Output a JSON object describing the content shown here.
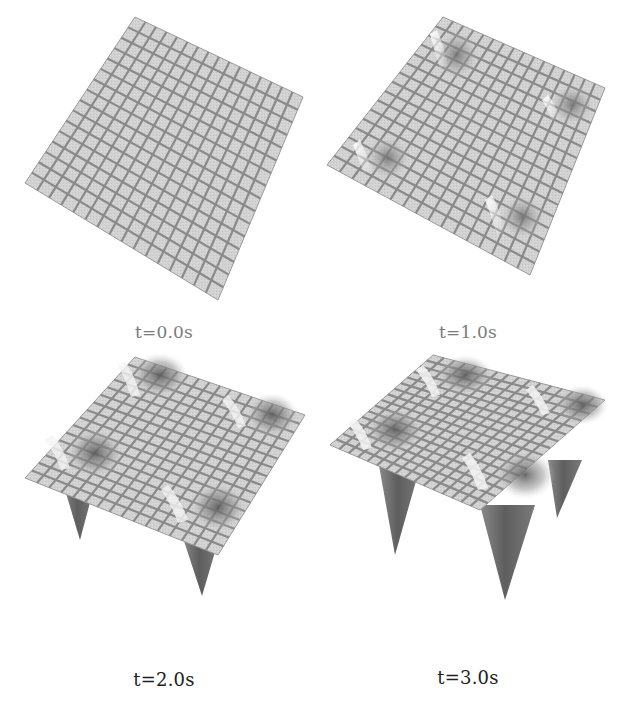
{
  "figure": {
    "panels": [
      {
        "id": "p0",
        "caption": "t=0.0s"
      },
      {
        "id": "p1",
        "caption": "t=1.0s"
      },
      {
        "id": "p2",
        "caption": "t=2.0s"
      },
      {
        "id": "p3",
        "caption": "t=3.0s"
      }
    ]
  },
  "colors": {
    "surface_fill": "#d0d0d0",
    "grid_line": "#8a8a8a",
    "dimple_shade": "#6e6e6e",
    "highlight": "#f2f2f2",
    "spike": "#6a6a6a",
    "caption_top": "#7a7a7a",
    "caption_bottom": "#1e1e1e"
  },
  "chart_data": [
    {
      "type": "surface",
      "title": "t=0.0s",
      "grid": "16x16",
      "description": "flat square mesh surface",
      "features": []
    },
    {
      "type": "surface",
      "title": "t=1.0s",
      "grid": "16x16",
      "description": "mesh surface with four shallow dimples near the corners",
      "features": [
        "dimple",
        "dimple",
        "dimple",
        "dimple"
      ]
    },
    {
      "type": "surface",
      "title": "t=2.0s",
      "grid": "16x16",
      "description": "mesh surface with four deeper depressions; two downward spikes visible below the plane",
      "features": [
        "depression",
        "depression",
        "depression+spike",
        "depression+spike"
      ]
    },
    {
      "type": "surface",
      "title": "t=3.0s",
      "grid": "16x16",
      "description": "mesh surface with four deep depressions; three long downward spikes visible below the plane",
      "features": [
        "depression",
        "depression+spike",
        "depression+spike",
        "depression+spike"
      ]
    }
  ]
}
